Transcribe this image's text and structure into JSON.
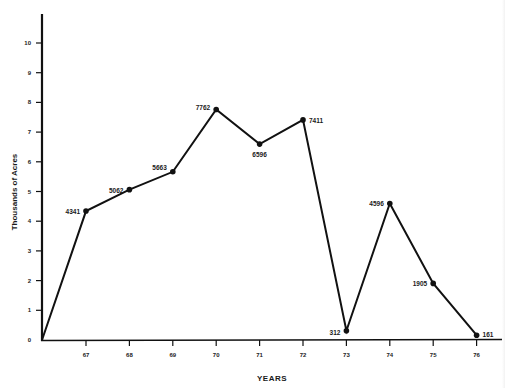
{
  "chart_data": {
    "type": "line",
    "title": "",
    "xlabel": "YEARS",
    "ylabel": "Thousands of Acres",
    "x_tick_labels": [
      "67",
      "68",
      "69",
      "70",
      "71",
      "72",
      "73",
      "74",
      "75",
      "76"
    ],
    "y_tick_labels": [
      "0",
      "1",
      "2",
      "3",
      "4",
      "5",
      "6",
      "7",
      "8",
      "9",
      "10"
    ],
    "ylim": [
      0,
      10
    ],
    "grid": false,
    "legend": null,
    "series": [
      {
        "name": "Acres",
        "x": [
          "66",
          "67",
          "68",
          "69",
          "70",
          "71",
          "72",
          "73",
          "74",
          "75",
          "76"
        ],
        "values": [
          0,
          4341,
          5062,
          5663,
          7762,
          6596,
          7411,
          312,
          4596,
          1905,
          161
        ],
        "point_labels": [
          "",
          "4341",
          "5062",
          "5663",
          "7762",
          "6596",
          "7411",
          "312",
          "4596",
          "1905",
          "161"
        ]
      }
    ]
  },
  "axes": {
    "x_title": "YEARS",
    "y_title": "Thousands of Acres"
  }
}
